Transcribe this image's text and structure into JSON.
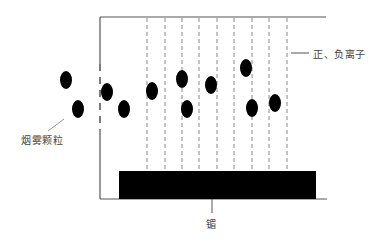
{
  "diagram": {
    "title": "",
    "colors": {
      "line": "#555555",
      "dashed": "#888888",
      "particle": "#000000",
      "electrode": "#000000",
      "text": "#444444"
    },
    "chamber": {
      "left_x": 100,
      "top_y": 17,
      "right_x": 328,
      "bottom_y": 239,
      "bottom_line_end_x": 327
    },
    "electrode_block": {
      "x": 119,
      "y": 171,
      "width": 197,
      "height": 28
    },
    "ion_lines_x": [
      147,
      165,
      182,
      199,
      217,
      234,
      252,
      269,
      287
    ],
    "ion_lines_y": [
      18,
      171
    ],
    "particles": [
      {
        "cx": 66,
        "cy": 80
      },
      {
        "cx": 78,
        "cy": 109
      },
      {
        "cx": 107,
        "cy": 92
      },
      {
        "cx": 124,
        "cy": 109
      },
      {
        "cx": 152,
        "cy": 91
      },
      {
        "cx": 182,
        "cy": 79
      },
      {
        "cx": 187,
        "cy": 109
      },
      {
        "cx": 211,
        "cy": 85
      },
      {
        "cx": 246,
        "cy": 68
      },
      {
        "cx": 252,
        "cy": 108
      },
      {
        "cx": 275,
        "cy": 103
      }
    ],
    "labels": {
      "ions": "正、负离子",
      "smoke_particles": "烟雾颗粒",
      "electrode": "镅"
    }
  }
}
